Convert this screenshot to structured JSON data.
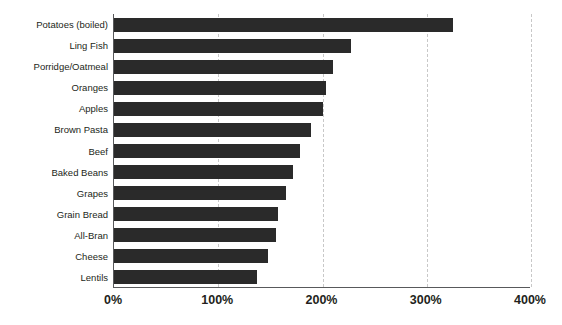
{
  "chart_data": {
    "type": "bar",
    "orientation": "horizontal",
    "title": "",
    "subtitle": "",
    "xlabel": "",
    "ylabel": "",
    "xlim": [
      0,
      400
    ],
    "ylim": null,
    "grid": true,
    "grid_axis": "x",
    "legend": false,
    "legend_position": "none",
    "bar_color": "#2a2a2a",
    "axis_color": "#58595b",
    "gridline_color": "#c8c8c8",
    "background_color": "#ffffff",
    "units": "percent",
    "categories": [
      "Potatoes (boiled)",
      "Ling Fish",
      "Porridge/Oatmeal",
      "Oranges",
      "Apples",
      "Brown Pasta",
      "Beef",
      "Baked Beans",
      "Grapes",
      "Grain Bread",
      "All-Bran",
      "Cheese",
      "Lentils"
    ],
    "values": [
      325,
      227,
      210,
      203,
      200,
      189,
      178,
      172,
      165,
      157,
      155,
      148,
      137
    ],
    "x_ticks": [
      0,
      100,
      200,
      300,
      400
    ],
    "x_tick_labels": [
      "0%",
      "100%",
      "200%",
      "300%",
      "400%"
    ]
  }
}
